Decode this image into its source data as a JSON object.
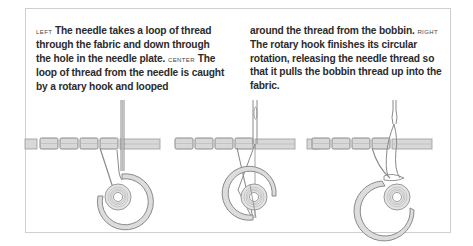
{
  "caption": {
    "left_column": [
      {
        "type": "label",
        "text": "LEFT"
      },
      {
        "type": "text",
        "text": " The needle takes a loop of thread through the fabric and down through the hole in the needle plate. "
      },
      {
        "type": "label",
        "text": "CENTER"
      },
      {
        "type": "text",
        "text": " The loop of thread from the needle is caught by a rotary hook and looped"
      }
    ],
    "right_column": [
      {
        "type": "text",
        "text": "around the thread from the bobbin. "
      },
      {
        "type": "label",
        "text": "RIGHT"
      },
      {
        "type": "text",
        "text": " The rotary hook finishes its circular rotation, releasing the needle thread so that it pulls the bobbin thread up into the fabric."
      }
    ]
  },
  "figure": {
    "panels": [
      {
        "name": "left",
        "description": "needle passing thread loop down through fabric and needle plate"
      },
      {
        "name": "center",
        "description": "rotary hook catching the needle thread loop around bobbin"
      },
      {
        "name": "right",
        "description": "hook releasing needle thread pulling bobbin thread up into fabric"
      }
    ],
    "colors": {
      "frame": "#cfcfcf",
      "fabric_fill": "#d6d6d6",
      "line": "#8a8a8a",
      "hook_fill": "#dcdcdc"
    }
  }
}
